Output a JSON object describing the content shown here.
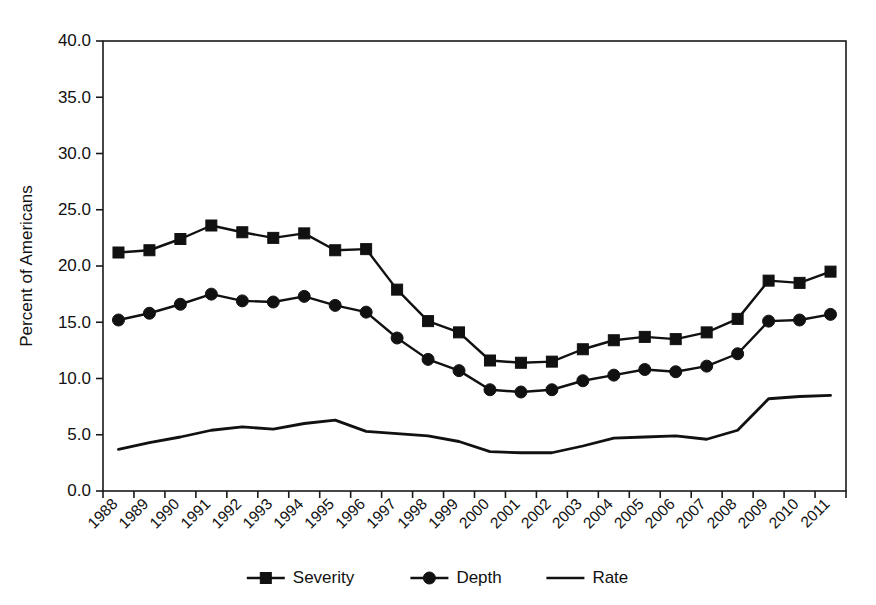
{
  "chart_data": {
    "type": "line",
    "title": "",
    "subtitle": "",
    "xlabel": "",
    "ylabel": "Percent of Americans",
    "ylim": [
      0,
      40
    ],
    "ytick_labels": [
      "0.0",
      "5.0",
      "10.0",
      "15.0",
      "20.0",
      "25.0",
      "30.0",
      "35.0",
      "40.0"
    ],
    "ytick_values": [
      0,
      5,
      10,
      15,
      20,
      25,
      30,
      35,
      40
    ],
    "grid": false,
    "legend_position": "bottom-center",
    "categories": [
      "1988",
      "1989",
      "1990",
      "1991",
      "1992",
      "1993",
      "1994",
      "1995",
      "1996",
      "1997",
      "1998",
      "1999",
      "2000",
      "2001",
      "2002",
      "2003",
      "2004",
      "2005",
      "2006",
      "2007",
      "2008",
      "2009",
      "2010",
      "2011"
    ],
    "series": [
      {
        "name": "Severity",
        "marker": "square",
        "color": "#111111",
        "values": [
          21.2,
          21.4,
          22.4,
          23.6,
          23.0,
          22.5,
          22.9,
          21.4,
          21.5,
          17.9,
          15.1,
          14.1,
          11.6,
          11.4,
          11.5,
          12.6,
          13.4,
          13.7,
          13.5,
          14.1,
          15.3,
          18.7,
          18.5,
          19.5
        ]
      },
      {
        "name": "Depth",
        "marker": "circle",
        "color": "#111111",
        "values": [
          15.2,
          15.8,
          16.6,
          17.5,
          16.9,
          16.8,
          17.3,
          16.5,
          15.9,
          13.6,
          11.7,
          10.7,
          9.0,
          8.8,
          9.0,
          9.8,
          10.3,
          10.8,
          10.6,
          11.1,
          12.2,
          15.1,
          15.2,
          15.7
        ]
      },
      {
        "name": "Rate",
        "marker": "none",
        "color": "#111111",
        "values": [
          3.7,
          4.3,
          4.8,
          5.4,
          5.7,
          5.5,
          6.0,
          6.3,
          5.3,
          5.1,
          4.9,
          4.4,
          3.5,
          3.4,
          3.4,
          4.0,
          4.7,
          4.8,
          4.9,
          4.6,
          5.4,
          8.2,
          8.4,
          8.5
        ]
      }
    ]
  },
  "legend": {
    "entries": [
      {
        "label": "Severity",
        "marker": "square"
      },
      {
        "label": "Depth",
        "marker": "circle"
      },
      {
        "label": "Rate",
        "marker": "none"
      }
    ]
  },
  "axes": {
    "y_title": "Percent of Americans"
  }
}
